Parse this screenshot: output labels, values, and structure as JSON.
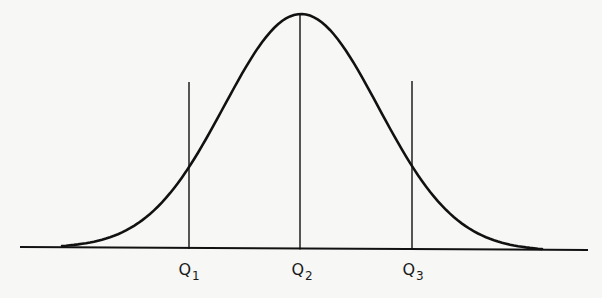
{
  "diagram": {
    "type": "distribution-quartiles",
    "stroke_color": "#111111",
    "background": "#f7f7f5",
    "baseline": {
      "x1": 20,
      "x2": 588,
      "y": 247
    },
    "curve": {
      "start": [
        62,
        246
      ],
      "peak": [
        301,
        14
      ],
      "end": [
        542,
        249
      ]
    },
    "quartiles": [
      {
        "name": "Q",
        "sub": "1",
        "x": 189,
        "top_y": 82,
        "label_x": 189
      },
      {
        "name": "Q",
        "sub": "2",
        "x": 300,
        "top_y": 15,
        "label_x": 302
      },
      {
        "name": "Q",
        "sub": "3",
        "x": 412,
        "top_y": 81,
        "label_x": 413
      }
    ]
  }
}
